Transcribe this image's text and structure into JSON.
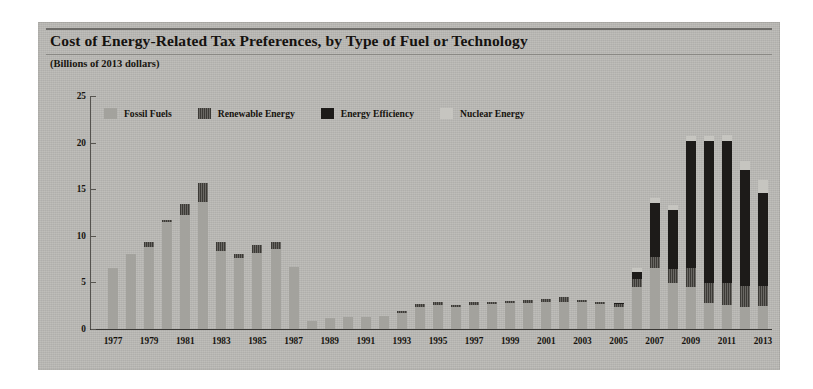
{
  "figure": {
    "title": "Cost of Energy-Related Tax Preferences, by Type of Fuel or Technology",
    "units_label": "(Billions of 2013 dollars)"
  },
  "legend": {
    "items": [
      {
        "label": "Fossil Fuels",
        "key": "fossil",
        "color": "#a3a29d"
      },
      {
        "label": "Renewable Energy",
        "key": "renew",
        "color": "#4e4c48"
      },
      {
        "label": "Energy Efficiency",
        "key": "eff",
        "color": "#1d1b19"
      },
      {
        "label": "Nuclear Energy",
        "key": "nuc",
        "color": "#c6c5c0"
      }
    ]
  },
  "chart_data": {
    "type": "bar",
    "stacked": true,
    "title": "Cost of Energy-Related Tax Preferences, by Type of Fuel or Technology",
    "xlabel": "",
    "ylabel": "Billions of 2013 dollars",
    "ylim": [
      0,
      25
    ],
    "yticks": [
      0,
      5,
      10,
      15,
      20,
      25
    ],
    "grid": false,
    "legend_position": "top",
    "x": [
      1977,
      1978,
      1979,
      1980,
      1981,
      1982,
      1983,
      1984,
      1985,
      1986,
      1987,
      1988,
      1989,
      1990,
      1991,
      1992,
      1993,
      1994,
      1995,
      1996,
      1997,
      1998,
      1999,
      2000,
      2001,
      2002,
      2003,
      2004,
      2005,
      2006,
      2007,
      2008,
      2009,
      2010,
      2011,
      2012,
      2013
    ],
    "xtick_labels": [
      "1977",
      "1979",
      "1981",
      "1983",
      "1985",
      "1987",
      "1989",
      "1991",
      "1993",
      "1995",
      "1997",
      "1999",
      "2001",
      "2003",
      "2005",
      "2007",
      "2009",
      "2011",
      "2013"
    ],
    "series": [
      {
        "name": "Fossil Fuels",
        "values": [
          6.5,
          8.0,
          8.8,
          11.4,
          12.2,
          13.6,
          8.3,
          7.6,
          8.1,
          8.6,
          6.6,
          0.8,
          1.1,
          1.2,
          1.2,
          1.3,
          1.7,
          2.3,
          2.5,
          2.3,
          2.5,
          2.6,
          2.7,
          2.7,
          2.8,
          2.9,
          2.8,
          2.6,
          2.3,
          4.5,
          6.5,
          4.9,
          4.5,
          2.7,
          2.5,
          2.3,
          2.4
        ]
      },
      {
        "name": "Renewable Energy",
        "values": [
          0.0,
          0.0,
          0.5,
          0.3,
          1.2,
          2.1,
          1.0,
          0.4,
          0.9,
          0.7,
          0.0,
          0.0,
          0.0,
          0.0,
          0.0,
          0.0,
          0.2,
          0.3,
          0.3,
          0.2,
          0.3,
          0.3,
          0.3,
          0.4,
          0.4,
          0.5,
          0.3,
          0.3,
          0.3,
          0.8,
          1.2,
          1.5,
          2.0,
          2.2,
          2.4,
          2.3,
          2.2
        ]
      },
      {
        "name": "Energy Efficiency",
        "values": [
          0.0,
          0.0,
          0.0,
          0.0,
          0.0,
          0.0,
          0.0,
          0.0,
          0.0,
          0.0,
          0.0,
          0.0,
          0.0,
          0.0,
          0.0,
          0.0,
          0.0,
          0.0,
          0.0,
          0.0,
          0.0,
          0.0,
          0.0,
          0.0,
          0.0,
          0.0,
          0.0,
          0.0,
          0.1,
          0.8,
          5.8,
          6.3,
          13.7,
          15.3,
          15.3,
          12.4,
          10.0
        ]
      },
      {
        "name": "Nuclear Energy",
        "values": [
          0.0,
          0.0,
          0.0,
          0.0,
          0.0,
          0.0,
          0.0,
          0.0,
          0.0,
          0.0,
          0.0,
          0.0,
          0.0,
          0.0,
          0.0,
          0.0,
          0.0,
          0.0,
          0.0,
          0.0,
          0.0,
          0.0,
          0.0,
          0.0,
          0.0,
          0.0,
          0.0,
          0.0,
          0.0,
          0.4,
          0.5,
          0.6,
          0.5,
          0.5,
          0.6,
          1.0,
          1.4
        ]
      }
    ],
    "totals": [
      6.5,
      8.0,
      9.3,
      11.7,
      13.4,
      15.7,
      9.3,
      8.0,
      9.0,
      9.3,
      6.6,
      0.8,
      1.1,
      1.2,
      1.2,
      1.3,
      1.9,
      2.6,
      2.8,
      2.5,
      2.8,
      2.9,
      3.0,
      3.1,
      3.2,
      3.4,
      3.1,
      2.9,
      2.7,
      6.5,
      14.0,
      13.3,
      20.7,
      20.7,
      20.8,
      18.0,
      16.0
    ]
  }
}
